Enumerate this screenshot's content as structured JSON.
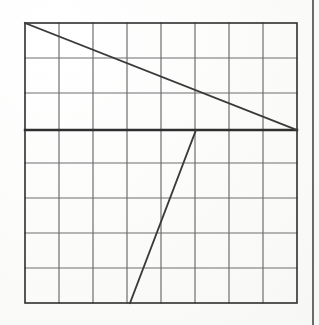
{
  "figure": {
    "caption": "Hand-drawn line graph on square grid paper",
    "background_color": "#fdfdfc",
    "ink_color": "#3a3a3a",
    "grid_line_color": "#6e6e6e",
    "axis_line_color": "#2f2f2f",
    "margin_rule_color": "#5a5a5a"
  },
  "grid": {
    "columns": 8,
    "rows": 8,
    "left": 25,
    "top": 23,
    "right": 297,
    "bottom": 303,
    "cell_width": 34,
    "cell_height": 35,
    "grid_stroke_width": 1.2,
    "border_stroke_width": 1.6,
    "emphasized_row_index": 3,
    "emphasized_row_y": 130,
    "emphasized_stroke_width": 2.4,
    "vertical_lines_x": [
      25,
      59,
      93,
      127,
      161,
      195,
      229,
      263,
      297
    ],
    "horizontal_lines_y": [
      23,
      58,
      93,
      128,
      163,
      198,
      233,
      268,
      303
    ]
  },
  "margin_rule": {
    "label": "page-margin-rule",
    "x": 313,
    "y_start": 0,
    "y_end": 325,
    "stroke_width": 1.8
  },
  "chart_data": {
    "type": "line",
    "title": "",
    "xlabel": "",
    "ylabel": "",
    "grid": true,
    "legend": "none",
    "axis_note": "Grid units: 8 columns x 8 rows. Emphasized horizontal rule at row 3 acts as the x-axis.",
    "xlim": [
      0,
      8
    ],
    "ylim": [
      0,
      8
    ],
    "x_tick_labels": [
      "0",
      "1",
      "2",
      "3",
      "4",
      "5",
      "6",
      "7",
      "8"
    ],
    "y_tick_labels": [
      "0",
      "1",
      "2",
      "3",
      "4",
      "5",
      "6",
      "7",
      "8"
    ],
    "series": [
      {
        "name": "descending-line",
        "stroke_width": 1.8,
        "points_px": [
          [
            25,
            23
          ],
          [
            297,
            130
          ]
        ],
        "points_grid": [
          [
            0,
            8
          ],
          [
            8,
            5
          ]
        ],
        "slope_grid": -0.375
      },
      {
        "name": "rising-line",
        "stroke_width": 1.8,
        "points_px": [
          [
            130,
            303
          ],
          [
            196,
            130
          ]
        ],
        "points_grid": [
          [
            3.09,
            0
          ],
          [
            5.03,
            5
          ]
        ],
        "slope_grid": 2.58
      }
    ]
  }
}
